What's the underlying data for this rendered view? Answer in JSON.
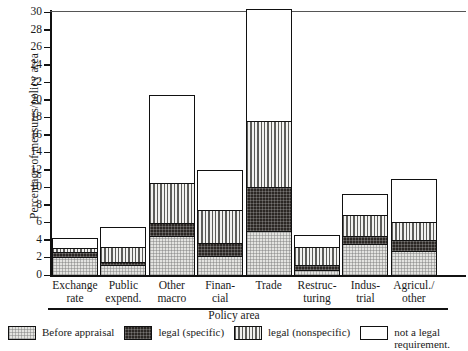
{
  "chart_data": {
    "type": "bar",
    "stacked": true,
    "title": "",
    "xlabel": "Policy area",
    "ylabel": "Percentage of measures/policy area",
    "ylim": [
      0,
      30
    ],
    "ytick_step": 2,
    "yticks": [
      0,
      2,
      4,
      6,
      8,
      10,
      12,
      14,
      16,
      18,
      20,
      22,
      24,
      26,
      28,
      30
    ],
    "grid": false,
    "legend_position": "bottom",
    "categories": [
      "Exchange rate",
      "Public expend.",
      "Other macro",
      "Financial",
      "Trade",
      "Restructuring",
      "Industrial",
      "Agricul./other"
    ],
    "category_lines": [
      [
        "Exchange",
        "rate"
      ],
      [
        "Public",
        "expend."
      ],
      [
        "Other",
        "macro"
      ],
      [
        "Finan-",
        "cial"
      ],
      [
        "Trade",
        ""
      ],
      [
        "Restruc-",
        "turing"
      ],
      [
        "Indus-",
        "trial"
      ],
      [
        "Agricul./",
        "other"
      ]
    ],
    "series": [
      {
        "name": "Before appraisal",
        "key": "before",
        "values": [
          2.0,
          1.0,
          4.4,
          2.1,
          4.9,
          0.5,
          3.5,
          2.6
        ]
      },
      {
        "name": "legal (specific)",
        "key": "specific",
        "values": [
          0.6,
          0.4,
          1.4,
          1.5,
          5.1,
          0.6,
          0.9,
          1.3
        ]
      },
      {
        "name": "legal (nonspecific)",
        "key": "nonspecific",
        "values": [
          0.4,
          1.7,
          4.6,
          3.8,
          7.5,
          2.1,
          2.4,
          2.1
        ]
      },
      {
        "name": "not a legal requirement.",
        "key": "notlegal",
        "values": [
          1.2,
          2.4,
          10.1,
          4.6,
          12.8,
          1.4,
          2.4,
          5.0
        ]
      }
    ],
    "totals": [
      4.2,
      5.5,
      20.5,
      12.0,
      30.3,
      4.6,
      9.2,
      11.0
    ]
  },
  "legend": {
    "items": [
      {
        "label": "Before appraisal",
        "swatch": "before"
      },
      {
        "label": "legal (specific)",
        "swatch": "specific"
      },
      {
        "label": "legal (nonspecific)",
        "swatch": "nonspecific"
      },
      {
        "label": "not a legal requirement.",
        "swatch": "notlegal"
      }
    ]
  },
  "colors": {
    "before": "#e3e3e0",
    "specific": "#2b2724",
    "nonspecific": "#d9d9d6",
    "notlegal": "#ffffff",
    "axis": "#111111"
  }
}
